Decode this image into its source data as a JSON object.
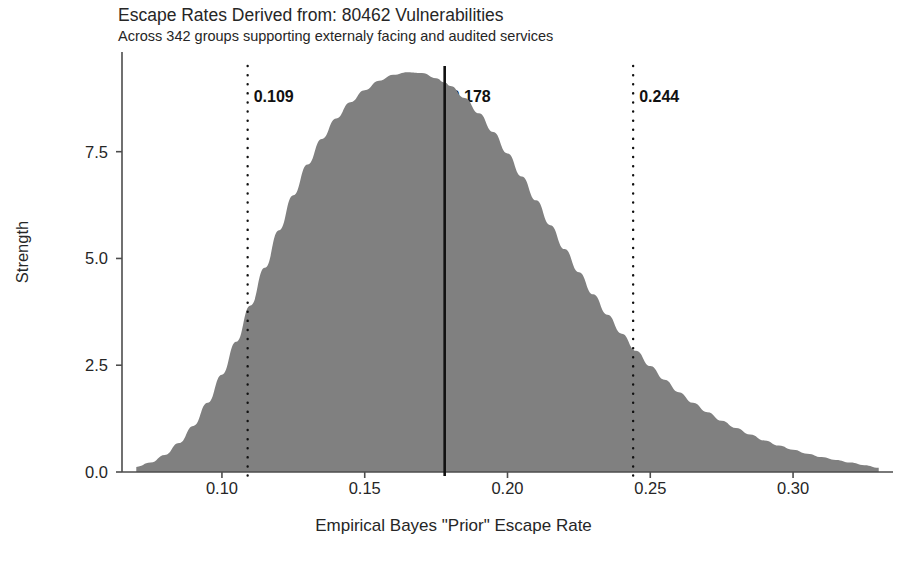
{
  "chart_data": {
    "type": "area",
    "title": "Escape Rates Derived from: 80462 Vulnerabilities",
    "subtitle": "Across 342 groups supporting externaly facing and audited services",
    "xlabel": "Empirical Bayes \"Prior\" Escape Rate",
    "ylabel": "Strength",
    "xlim": [
      0.065,
      0.335
    ],
    "ylim": [
      0.0,
      9.6
    ],
    "xticks": [
      {
        "value": 0.1,
        "label": "0.10"
      },
      {
        "value": 0.15,
        "label": "0.15"
      },
      {
        "value": 0.2,
        "label": "0.20"
      },
      {
        "value": 0.25,
        "label": "0.25"
      },
      {
        "value": 0.3,
        "label": "0.30"
      }
    ],
    "yticks": [
      {
        "value": 0.0,
        "label": "0.0"
      },
      {
        "value": 2.5,
        "label": "2.5"
      },
      {
        "value": 5.0,
        "label": "5.0"
      },
      {
        "value": 7.5,
        "label": "7.5"
      }
    ],
    "grid": false,
    "legend": "none",
    "fill_color": "#808080",
    "series": [
      {
        "name": "Empirical Bayes prior density",
        "x": [
          0.07,
          0.075,
          0.08,
          0.085,
          0.09,
          0.095,
          0.1,
          0.105,
          0.11,
          0.115,
          0.12,
          0.125,
          0.13,
          0.135,
          0.14,
          0.145,
          0.15,
          0.155,
          0.16,
          0.165,
          0.17,
          0.175,
          0.178,
          0.18,
          0.185,
          0.19,
          0.195,
          0.2,
          0.205,
          0.21,
          0.215,
          0.22,
          0.225,
          0.23,
          0.235,
          0.24,
          0.245,
          0.25,
          0.255,
          0.26,
          0.265,
          0.27,
          0.275,
          0.28,
          0.285,
          0.29,
          0.295,
          0.3,
          0.305,
          0.31,
          0.315,
          0.32,
          0.325,
          0.33
        ],
        "y": [
          0.12,
          0.22,
          0.4,
          0.68,
          1.08,
          1.62,
          2.28,
          3.05,
          3.9,
          4.78,
          5.66,
          6.48,
          7.2,
          7.8,
          8.28,
          8.66,
          8.94,
          9.16,
          9.3,
          9.36,
          9.34,
          9.22,
          9.12,
          9.04,
          8.76,
          8.4,
          7.96,
          7.46,
          6.92,
          6.36,
          5.78,
          5.22,
          4.68,
          4.16,
          3.68,
          3.24,
          2.84,
          2.48,
          2.16,
          1.87,
          1.62,
          1.4,
          1.2,
          1.03,
          0.88,
          0.74,
          0.62,
          0.52,
          0.43,
          0.35,
          0.28,
          0.22,
          0.16,
          0.1
        ]
      }
    ],
    "annotations": [
      {
        "name": "lower-bound",
        "value": 0.109,
        "label": "0.109",
        "line_style": "dotted"
      },
      {
        "name": "center",
        "value": 0.178,
        "label": "0.178",
        "line_style": "solid"
      },
      {
        "name": "upper-bound",
        "value": 0.244,
        "label": "0.244",
        "line_style": "dotted"
      }
    ]
  }
}
